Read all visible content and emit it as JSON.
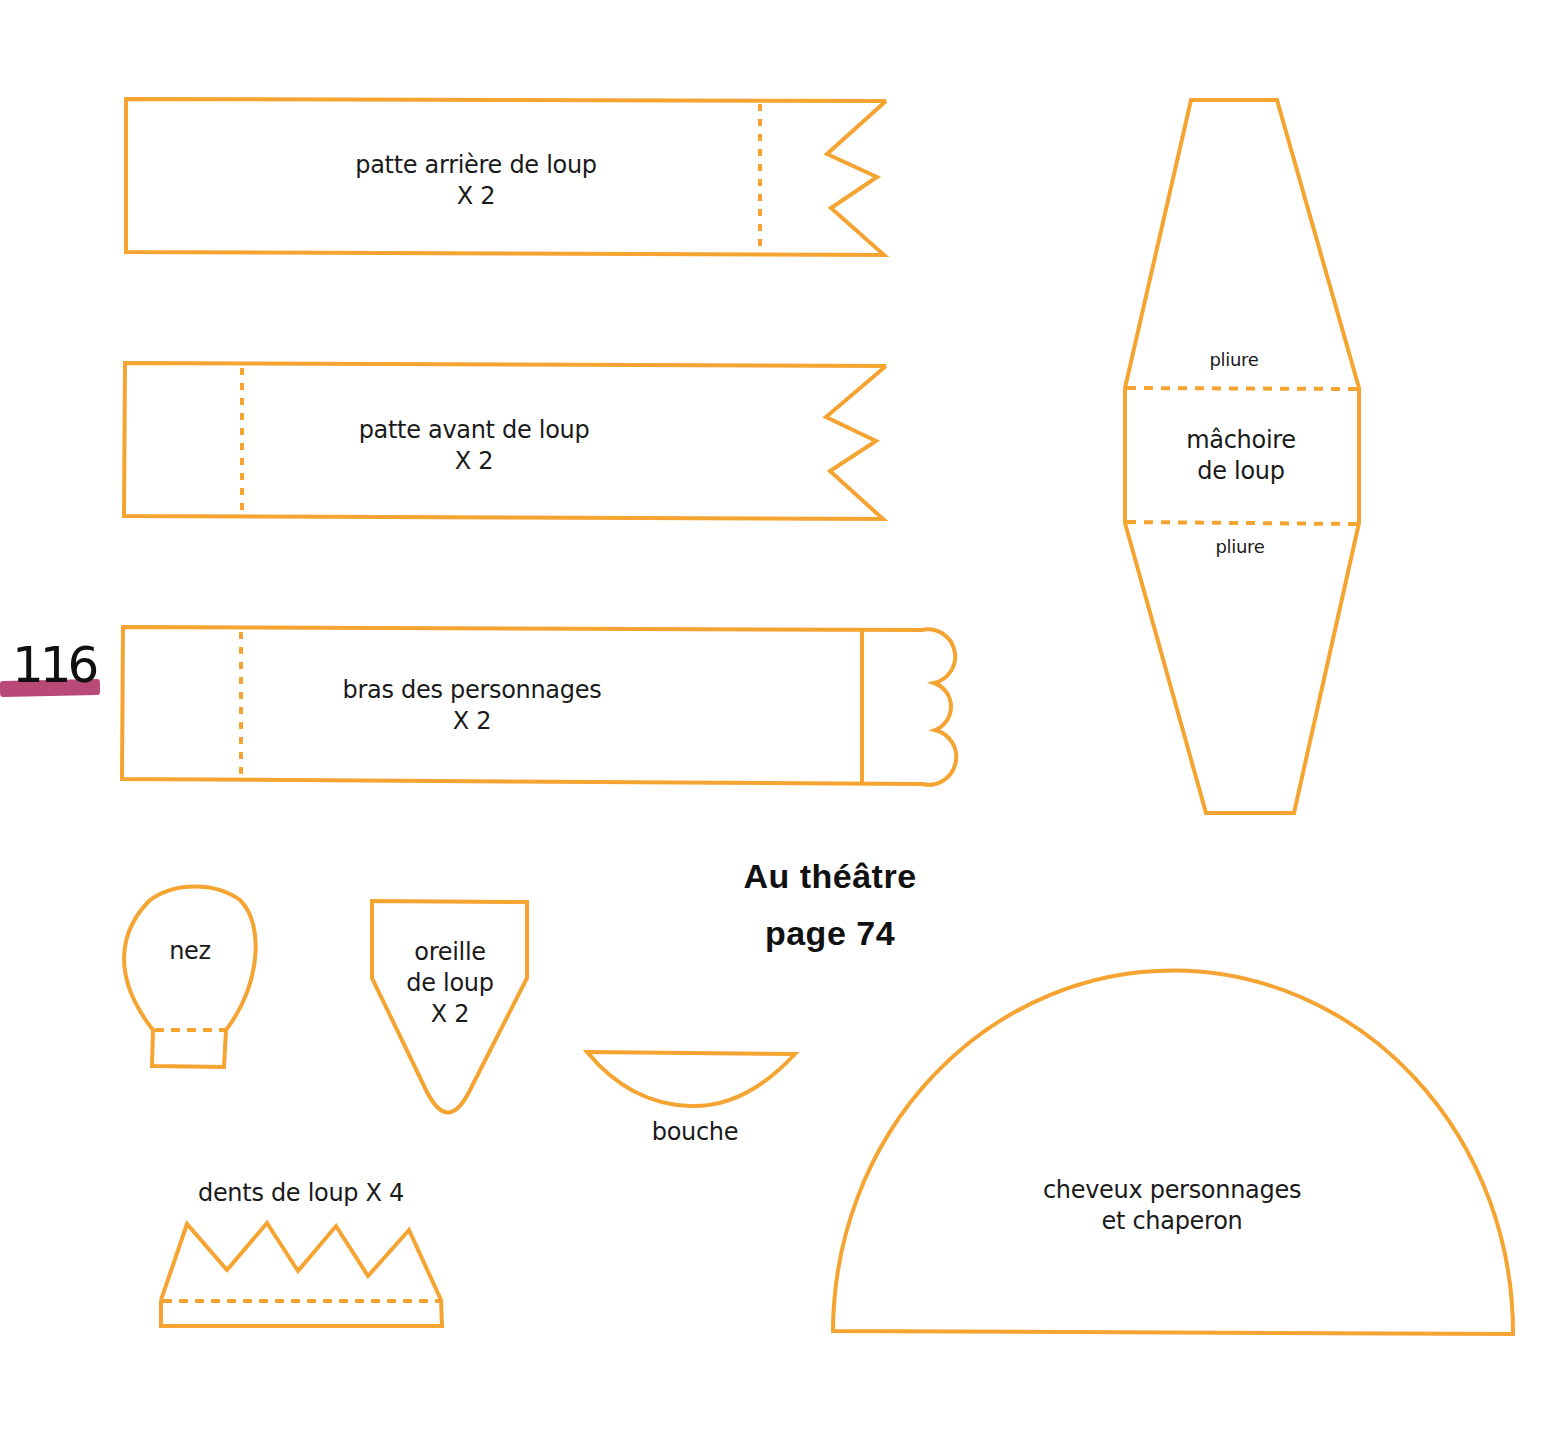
{
  "page": {
    "page_number": "116",
    "title": "Au théâtre",
    "reference": "page 74",
    "stroke_color": "#f5a431",
    "marker_color": "#b3396a"
  },
  "pieces": {
    "patte_arriere": {
      "line1": "patte arrière de loup",
      "line2": "X 2"
    },
    "patte_avant": {
      "line1": "patte avant de loup",
      "line2": "X 2"
    },
    "bras": {
      "line1": "bras des personnages",
      "line2": "X 2"
    },
    "machoire": {
      "line1": "mâchoire",
      "line2": "de loup",
      "fold_top": "pliure",
      "fold_bottom": "pliure"
    },
    "nez": {
      "label": "nez"
    },
    "oreille": {
      "line1": "oreille",
      "line2": "de loup",
      "line3": "X 2"
    },
    "bouche": {
      "label": "bouche"
    },
    "dents": {
      "label": "dents de loup X 4"
    },
    "cheveux": {
      "line1": "cheveux personnages",
      "line2": "et chaperon"
    }
  }
}
